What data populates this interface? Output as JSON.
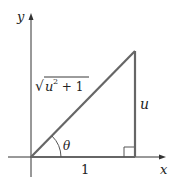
{
  "diagram": {
    "axes": {
      "x_label": "x",
      "y_label": "y"
    },
    "triangle": {
      "hypotenuse_label_radical": "√",
      "hypotenuse_label_base": "u",
      "hypotenuse_label_exp": "2",
      "hypotenuse_label_rest": " + 1",
      "opposite_label": "u",
      "adjacent_label": "1",
      "angle_label": "θ"
    },
    "colors": {
      "triangle": "#666666",
      "axes": "#333333"
    }
  }
}
